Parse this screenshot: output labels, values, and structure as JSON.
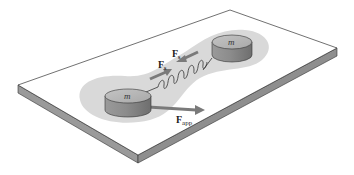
{
  "diagram": {
    "type": "physics-illustration",
    "masses": [
      {
        "id": "left",
        "label": "m"
      },
      {
        "id": "right",
        "label": "m"
      }
    ],
    "forces": {
      "spring_force_lower": {
        "symbol": "F",
        "subscript": "s"
      },
      "spring_force_upper": {
        "symbol": "F",
        "subscript": "s"
      },
      "applied_force": {
        "symbol": "F",
        "subscript": "app"
      }
    },
    "colors": {
      "table_top": "#ffffff",
      "table_edge": "#9a9a9a",
      "system_region": "#d9d9d9",
      "mass_side": "#8a8a8a",
      "mass_top": "#b5b5b5",
      "arrow": "#7a7a7a",
      "outline": "#333333"
    }
  }
}
